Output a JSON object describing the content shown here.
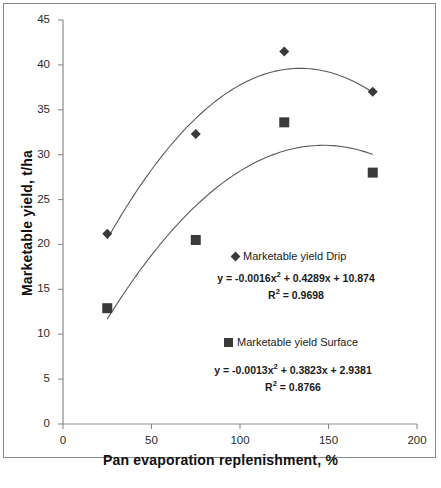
{
  "chart_data": {
    "type": "scatter",
    "title": "",
    "xlabel": "Pan evaporation replenishment, %",
    "ylabel": "Marketable yield, t/ha",
    "xlim": [
      0,
      200
    ],
    "ylim": [
      0,
      45
    ],
    "xticks": [
      "0",
      "50",
      "100",
      "150",
      "200"
    ],
    "yticks": [
      "0",
      "5",
      "10",
      "15",
      "20",
      "25",
      "30",
      "35",
      "40",
      "45"
    ],
    "grid": false,
    "legend_position": "inside-right",
    "series": [
      {
        "name": "Marketable yield Drip",
        "marker": "diamond",
        "color": "#3a3a3a",
        "x": [
          25,
          75,
          125,
          175
        ],
        "values": [
          21.2,
          32.3,
          41.5,
          37.0
        ],
        "trendline": {
          "equation": "y = -0.0016x² + 0.4289x + 10.874",
          "r_squared": "R² = 0.9698",
          "a": -0.0016,
          "b": 0.4289,
          "c": 10.874,
          "r2": 0.9698
        }
      },
      {
        "name": "Marketable yield Surface",
        "marker": "square",
        "color": "#3a3a3a",
        "x": [
          25,
          75,
          125,
          175
        ],
        "values": [
          12.9,
          20.5,
          33.6,
          28.0
        ],
        "trendline": {
          "equation": "y = -0.0013x² + 0.3823x + 2.9381",
          "r_squared": "R² = 0.8766",
          "a": -0.0013,
          "b": 0.3823,
          "c": 2.9381,
          "r2": 0.8766
        }
      }
    ]
  },
  "annotations": {
    "drip_legend_label": "Marketable yield Drip",
    "drip_equation": "y = -0.0016x² + 0.4289x + 10.874",
    "drip_r2": "R² = 0.9698",
    "surface_legend_label": "Marketable yield Surface",
    "surface_equation": "y = -0.0013x² + 0.3823x + 2.9381",
    "surface_r2": "R² = 0.8766"
  },
  "axes": {
    "x_title": "Pan evaporation replenishment, %",
    "y_title": "Marketable yield, t/ha"
  },
  "colors": {
    "marker": "#3a3a3a",
    "axis": "#8a8a8a",
    "text": "#1a1a1a",
    "background": "#ffffff"
  }
}
